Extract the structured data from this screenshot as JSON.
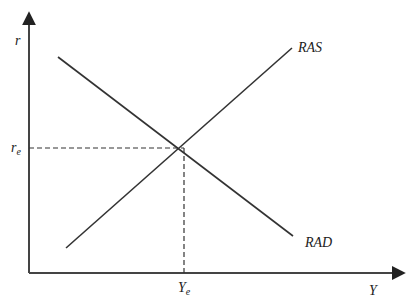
{
  "diagram": {
    "type": "supply-demand",
    "axes": {
      "y_label": "r",
      "x_label": "Y"
    },
    "curves": [
      {
        "id": "ras",
        "label": "RAS",
        "slope": "upward"
      },
      {
        "id": "rad",
        "label": "RAD",
        "slope": "downward"
      }
    ],
    "equilibrium": {
      "r_label": "r",
      "r_sub": "e",
      "y_label": "Y",
      "y_sub": "e"
    },
    "colors": {
      "line": "#333333",
      "axis": "#444444",
      "background": "#ffffff"
    }
  }
}
